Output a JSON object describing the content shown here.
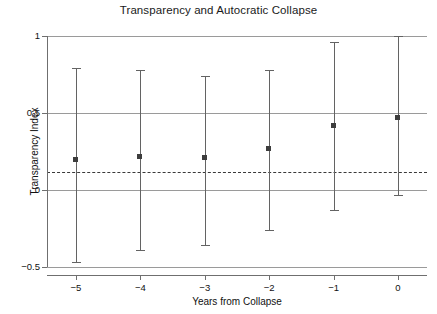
{
  "chart_data": {
    "type": "scatter",
    "title": "Transparency and Autocratic Collapse",
    "xlabel": "Years from Collapse",
    "ylabel": "Transparency Index",
    "x": [
      -5,
      -4,
      -3,
      -2,
      -1,
      0
    ],
    "xtick_labels": [
      "−5",
      "−4",
      "−3",
      "−2",
      "−1",
      "0"
    ],
    "ytick_labels": [
      "1",
      "0.5",
      "0",
      "−0.5"
    ],
    "yticks": [
      1,
      0.5,
      0,
      -0.5
    ],
    "ylim": [
      -0.5,
      1
    ],
    "xlim": [
      -5.45,
      0.45
    ],
    "grid": true,
    "grid_axis": "y",
    "legend": "none",
    "series": [
      {
        "name": "Transparency Index point estimate",
        "values": [
          0.2,
          0.22,
          0.21,
          0.27,
          0.42,
          0.47
        ],
        "error_low": [
          -0.47,
          -0.39,
          -0.36,
          -0.26,
          -0.13,
          -0.03
        ],
        "error_high": [
          0.79,
          0.78,
          0.74,
          0.78,
          0.96,
          1.0
        ]
      }
    ],
    "reference_line": {
      "name": "mean reference",
      "value": 0.12,
      "style": "dashed",
      "orientation": "horizontal"
    },
    "colors": {
      "marker": "#3d3d3d",
      "whisker": "#636363",
      "gridline": "#9a9a9a",
      "reference_line": "#3a3a3a",
      "axis": "#6f6f6f",
      "text": "#111111",
      "background": "#ffffff"
    }
  }
}
